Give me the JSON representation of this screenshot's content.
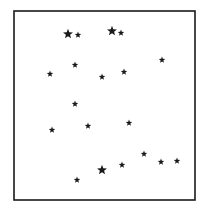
{
  "figure": {
    "width": 205,
    "height": 212,
    "background": "#ffffff",
    "ink_color": "#1a1a1a",
    "frame": {
      "x": 14,
      "y": 11,
      "width": 181,
      "height": 189,
      "stroke_width": 1.6
    },
    "stars": [
      {
        "x": 68,
        "y": 34,
        "size": "large"
      },
      {
        "x": 78,
        "y": 35,
        "size": "small"
      },
      {
        "x": 112,
        "y": 31,
        "size": "large"
      },
      {
        "x": 121,
        "y": 33,
        "size": "small"
      },
      {
        "x": 162,
        "y": 60,
        "size": "small"
      },
      {
        "x": 75,
        "y": 65,
        "size": "small"
      },
      {
        "x": 50,
        "y": 74,
        "size": "small"
      },
      {
        "x": 124,
        "y": 72,
        "size": "small"
      },
      {
        "x": 102,
        "y": 77,
        "size": "small"
      },
      {
        "x": 75,
        "y": 104,
        "size": "small"
      },
      {
        "x": 52,
        "y": 130,
        "size": "small"
      },
      {
        "x": 88,
        "y": 126,
        "size": "small"
      },
      {
        "x": 129,
        "y": 123,
        "size": "small"
      },
      {
        "x": 144,
        "y": 154,
        "size": "small"
      },
      {
        "x": 161,
        "y": 162,
        "size": "small"
      },
      {
        "x": 177,
        "y": 161,
        "size": "small"
      },
      {
        "x": 122,
        "y": 165,
        "size": "small"
      },
      {
        "x": 102,
        "y": 170,
        "size": "large"
      },
      {
        "x": 77,
        "y": 180,
        "size": "small"
      }
    ],
    "star_radius": {
      "large": 5.2,
      "small": 3.4
    }
  }
}
